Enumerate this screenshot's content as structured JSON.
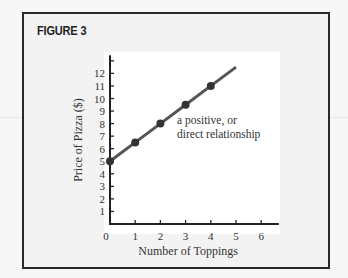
{
  "figure": {
    "title": "FIGURE 3"
  },
  "chart_data": {
    "type": "line",
    "title": "FIGURE 3",
    "xlabel": "Number of Toppings",
    "ylabel": "Price of Pizza ($)",
    "x_ticks": [
      "0",
      "1",
      "2",
      "3",
      "4",
      "5",
      "6"
    ],
    "y_ticks": [
      "1",
      "2",
      "3",
      "4",
      "5",
      "6",
      "7",
      "8",
      "9",
      "10",
      "11",
      "12"
    ],
    "xlim": [
      0,
      6.7
    ],
    "ylim": [
      0,
      13.2
    ],
    "grid": false,
    "legend": null,
    "series": [
      {
        "name": "Price of Pizza",
        "line_color": "#555555",
        "marker_color": "#333333",
        "points": [
          {
            "x": 0,
            "y": 5
          },
          {
            "x": 1,
            "y": 6.5
          },
          {
            "x": 2,
            "y": 8
          },
          {
            "x": 3,
            "y": 9.5
          },
          {
            "x": 4,
            "y": 11
          }
        ],
        "line_extends_to": {
          "x": 5,
          "y": 12.5
        }
      }
    ],
    "annotations": [
      {
        "text_lines": [
          "a positive, or",
          "direct relationship"
        ],
        "x": 2.7,
        "y": 8
      }
    ]
  }
}
